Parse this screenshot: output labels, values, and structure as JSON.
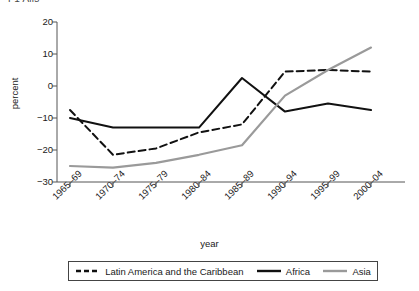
{
  "figure": {
    "cut_top_text": "F1 Alls",
    "xlabel": "year",
    "ylabel": "percent"
  },
  "legend": {
    "entries": [
      {
        "label": "Latin America and the Caribbean",
        "style": "dashed",
        "color": "#111111",
        "icon": "dashed-line-swatch"
      },
      {
        "label": "Africa",
        "style": "solid",
        "color": "#111111",
        "icon": "solid-line-swatch"
      },
      {
        "label": "Asia",
        "style": "solid",
        "color": "#9a9a9a",
        "icon": "solid-line-swatch"
      }
    ]
  },
  "chart_data": {
    "type": "line",
    "title": "",
    "xlabel": "year",
    "ylabel": "percent",
    "categories": [
      "1965–69",
      "1970–74",
      "1975–79",
      "1980–84",
      "1985–89",
      "1990–94",
      "1995–99",
      "2000–04"
    ],
    "ylim": [
      -30,
      20
    ],
    "yticks": [
      20,
      10,
      0,
      -10,
      -20,
      -30
    ],
    "ytick_labels": [
      "20",
      "10",
      "0",
      "−10",
      "−20",
      "−30"
    ],
    "grid": false,
    "legend_position": "bottom",
    "series": [
      {
        "name": "Latin America and the Caribbean",
        "color": "#111111",
        "style": "dashed",
        "values": [
          -7.5,
          -21.5,
          -19.5,
          -14.5,
          -12,
          4.5,
          5,
          4.5
        ]
      },
      {
        "name": "Africa",
        "color": "#111111",
        "style": "solid",
        "values": [
          -10,
          -13,
          -13,
          -13,
          2.5,
          -8,
          -5.5,
          -7.5
        ]
      },
      {
        "name": "Asia",
        "color": "#9a9a9a",
        "style": "solid",
        "values": [
          -25,
          -25.5,
          -24,
          -21.5,
          -18.5,
          -3,
          5,
          12
        ]
      }
    ]
  }
}
